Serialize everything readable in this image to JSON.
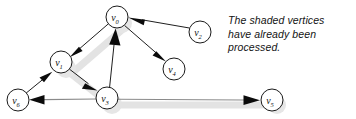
{
  "figure": {
    "kind": "directed-graph-diagram",
    "width": 356,
    "height": 119,
    "background": "#ffffff"
  },
  "caption": {
    "line1": "The shaded vertices",
    "line2": "have already been",
    "line3": "processed."
  },
  "graph": {
    "vertex_radius": 11,
    "vertices": [
      {
        "id": "v0",
        "base": "v",
        "sub": "0",
        "cx": 117,
        "cy": 17,
        "shaded": true
      },
      {
        "id": "v1",
        "base": "v",
        "sub": "1",
        "cx": 61,
        "cy": 62,
        "shaded": true
      },
      {
        "id": "v2",
        "base": "v",
        "sub": "2",
        "cx": 200,
        "cy": 32,
        "shaded": false
      },
      {
        "id": "v3",
        "base": "v",
        "sub": "3",
        "cx": 107,
        "cy": 98,
        "shaded": true
      },
      {
        "id": "v4",
        "base": "v",
        "sub": "4",
        "cx": 174,
        "cy": 69,
        "shaded": false
      },
      {
        "id": "v5",
        "base": "v",
        "sub": "5",
        "cx": 272,
        "cy": 100,
        "shaded": false
      },
      {
        "id": "v6",
        "base": "v",
        "sub": "6",
        "cx": 18,
        "cy": 100,
        "shaded": false
      }
    ],
    "edges": [
      {
        "from": "v0",
        "to": "v1",
        "style": "black",
        "label": ""
      },
      {
        "from": "v0",
        "to": "v4",
        "style": "black",
        "label": ""
      },
      {
        "from": "v2",
        "to": "v0",
        "style": "black",
        "label": ""
      },
      {
        "from": "v3",
        "to": "v0",
        "style": "black",
        "label": ""
      },
      {
        "from": "v1",
        "to": "v3",
        "style": "black",
        "label": ""
      },
      {
        "from": "v6",
        "to": "v1",
        "style": "black",
        "label": ""
      },
      {
        "from": "v3",
        "to": "v6",
        "style": "gray",
        "label": ""
      },
      {
        "from": "v3",
        "to": "v5",
        "style": "gray",
        "label": ""
      }
    ],
    "shaded_path": [
      "v0",
      "v1",
      "v3"
    ],
    "colors": {
      "edge": "#1f1f1f",
      "edge_gray": "#8a8a8a",
      "vertex_stroke": "#1a1a1a",
      "vertex_fill": "#ffffff",
      "shade": "#e3e3e3",
      "text": "#131313"
    }
  }
}
